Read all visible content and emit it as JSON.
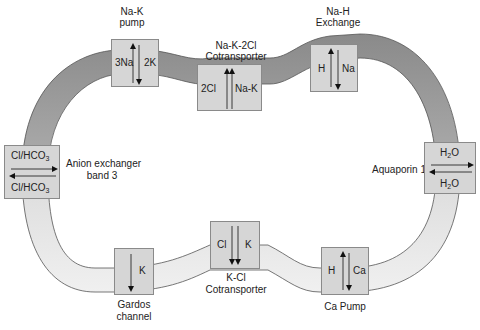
{
  "colors": {
    "membrane_top": "#8f8f8f",
    "membrane_bottom": "#ededed",
    "membrane_stroke": "#555555",
    "box_fill": "#d6d6d6",
    "box_stroke": "#8a8a8a",
    "arrow": "#111111"
  },
  "transporters": {
    "na_k_pump": {
      "title_line1": "Na-K",
      "title_line2": "pump",
      "left": "3Na",
      "right": "2K",
      "arrows": [
        "up",
        "down"
      ]
    },
    "nkcc": {
      "title_line1": "Na-K-2Cl",
      "title_line2": "Cotransporter",
      "left": "2Cl",
      "right": "Na-K",
      "arrows": [
        "up",
        "up"
      ]
    },
    "na_h": {
      "title_line1": "Na-H",
      "title_line2": "Exchange",
      "left": "H",
      "right": "Na",
      "arrows": [
        "up",
        "down"
      ]
    },
    "anion_exchanger": {
      "top": "Cl/HCO",
      "top_sub": "3",
      "bottom": "Cl/HCO",
      "bottom_sub": "3",
      "caption_line1": "Anion exchanger",
      "caption_line2": "band 3",
      "arrows": [
        "right",
        "left"
      ]
    },
    "aquaporin": {
      "top": "H",
      "top_sub": "2",
      "top_tail": "O",
      "bottom": "H",
      "bottom_sub": "2",
      "bottom_tail": "O",
      "caption": "Aquaporin 1",
      "arrows": [
        "right",
        "left"
      ]
    },
    "gardos": {
      "label": "K",
      "caption_line1": "Gardos",
      "caption_line2": "channel",
      "arrows": [
        "down"
      ]
    },
    "kcl": {
      "left": "Cl",
      "right": "K",
      "caption_line1": "K-Cl",
      "caption_line2": "Cotransporter",
      "arrows": [
        "down",
        "down"
      ]
    },
    "ca_pump": {
      "left": "H",
      "right": "Ca",
      "caption": "Ca Pump",
      "arrows": [
        "up",
        "down"
      ]
    }
  }
}
